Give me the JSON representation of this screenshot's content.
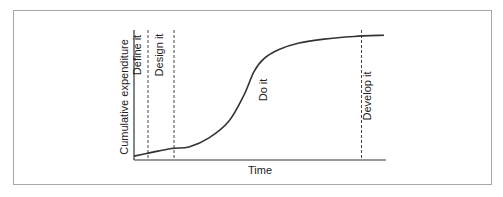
{
  "chart_data": {
    "type": "line",
    "title": "",
    "xlabel": "Time",
    "ylabel": "Cumulative expenditure",
    "x_ticks": [],
    "y_ticks": [],
    "xlim": [
      0,
      100
    ],
    "ylim": [
      0,
      100
    ],
    "grid": false,
    "series": [
      {
        "name": "Cumulative expenditure",
        "x": [
          0,
          5,
          10,
          16,
          22,
          30,
          38,
          44,
          48,
          52,
          58,
          66,
          76,
          88,
          100
        ],
        "y": [
          3,
          5,
          7,
          9,
          10,
          17,
          30,
          50,
          68,
          78,
          85,
          90,
          93,
          95,
          96
        ]
      }
    ],
    "phases": [
      {
        "label": "Define it",
        "boundary_x": 5.6
      },
      {
        "label": "Design it",
        "boundary_x": 16
      },
      {
        "label": "Do it",
        "boundary_x": null
      },
      {
        "label": "Develop it",
        "boundary_x": 91
      }
    ]
  }
}
